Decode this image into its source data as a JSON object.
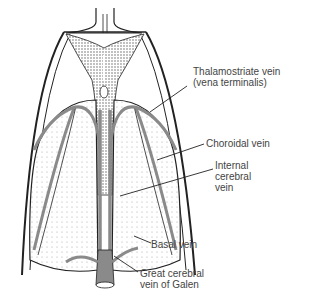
{
  "diagram": {
    "labels": [
      {
        "id": "thalamostriate",
        "line1": "Thalamostriate vein",
        "line2": "(vena terminalis)"
      },
      {
        "id": "choroidal",
        "line1": "Choroidal vein"
      },
      {
        "id": "internal-cerebral",
        "line1": "Internal",
        "line2": "cerebral",
        "line3": "vein"
      },
      {
        "id": "basal",
        "line1": "Basal vein"
      },
      {
        "id": "galen",
        "line1": "Great cerebral",
        "line2": "vein of Galen"
      }
    ],
    "colors": {
      "ink": "#222222",
      "vein": "#8a8a8a",
      "stipple": "#9a9a9a",
      "background": "#ffffff"
    }
  }
}
